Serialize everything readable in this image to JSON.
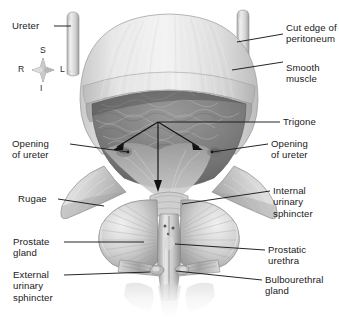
{
  "figure": {
    "orientation": {
      "superior": "S",
      "inferior": "I",
      "right": "R",
      "left": "L"
    }
  },
  "labels": {
    "ureter": "Ureter",
    "cut_edge_of_peritoneum": "Cut edge of\nperitoneum",
    "smooth_muscle": "Smooth\nmuscle",
    "trigone": "Trigone",
    "opening_of_ureter_left": "Opening\nof ureter",
    "opening_of_ureter_right": "Opening\nof ureter",
    "rugae": "Rugae",
    "internal_urinary_sphincter": "Internal\nurinary\nsphincter",
    "prostate_gland": "Prostate\ngland",
    "prostatic_urethra": "Prostatic\nurethra",
    "external_urinary_sphincter": "External\nurinary\nsphincter",
    "bulbourethral_gland": "Bulbourethral\ngland"
  },
  "colors": {
    "background": "#ffffff",
    "leader_line": "#1a1a1a",
    "text": "#1a1a1a",
    "tissue_light": "#e2e2e2",
    "tissue_mid": "#b9b9b9",
    "tissue_dark": "#7d7d7d",
    "interior_dark": "#6e6e6e",
    "outline": "#5a5a5a"
  }
}
